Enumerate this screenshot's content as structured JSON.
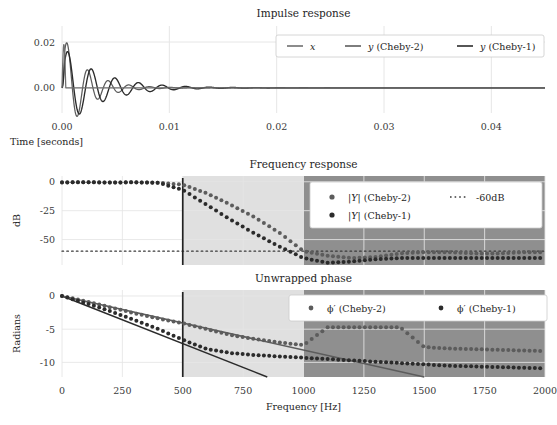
{
  "figure": {
    "width": 557,
    "height": 425,
    "background": "#ffffff"
  },
  "colors": {
    "x_series": "#6f6f6f",
    "cheby2": "#5c5c5c",
    "cheby1": "#2b2b2b",
    "ref_line": "#3a3a3a",
    "grid": "#e6e6e6",
    "transition_band": "#e0e0e0",
    "stop_band": "#8f8f8f",
    "cutoff_line": "#222222",
    "text": "#262626",
    "legend_face": "#ffffff",
    "legend_edge": "#cccccc"
  },
  "panels": [
    {
      "id": "impulse",
      "title": "Impulse response",
      "xlabel": "Time [seconds]",
      "ylabel": "",
      "xticks": [
        "0.00",
        "0.01",
        "0.02",
        "0.03",
        "0.04"
      ],
      "xtick_values": [
        0.0,
        0.01,
        0.02,
        0.03,
        0.04
      ],
      "yticks": [
        "0.02",
        "0.00"
      ],
      "ytick_values": [
        0.02,
        0.0
      ],
      "xlim": [
        0.0,
        0.045
      ],
      "ylim": [
        -0.011,
        0.027
      ],
      "legend": [
        {
          "label": "x",
          "marker": "line",
          "color": "#6f6f6f"
        },
        {
          "label": "y (Cheby-2)",
          "marker": "line",
          "color": "#5c5c5c"
        },
        {
          "label": "y (Cheby-1)",
          "marker": "line",
          "color": "#2b2b2b"
        }
      ]
    },
    {
      "id": "frequency",
      "title": "Frequency response",
      "xlabel": "",
      "ylabel": "dB",
      "yticks": [
        "0",
        "-25",
        "-50"
      ],
      "ytick_values": [
        0,
        -25,
        -50
      ],
      "xlim": [
        0,
        2000
      ],
      "ylim": [
        -72,
        5
      ],
      "legend": [
        {
          "label": "|Y| (Cheby-2)",
          "marker": "dot",
          "color": "#5c5c5c"
        },
        {
          "label": "-60dB",
          "marker": "dotline",
          "color": "#3a3a3a"
        },
        {
          "label": "|Y| (Cheby-1)",
          "marker": "dot",
          "color": "#2b2b2b"
        }
      ],
      "reference_level_db": -60
    },
    {
      "id": "phase",
      "title": "Unwrapped phase",
      "xlabel": "Frequency [Hz]",
      "ylabel": "Radians",
      "xticks": [
        "0",
        "250",
        "500",
        "750",
        "1000",
        "1250",
        "1500",
        "1750",
        "2000"
      ],
      "xtick_values": [
        0,
        250,
        500,
        750,
        1000,
        1250,
        1500,
        1750,
        2000
      ],
      "yticks": [
        "0",
        "-5",
        "-10"
      ],
      "ytick_values": [
        0,
        -5,
        -10
      ],
      "xlim": [
        0,
        2000
      ],
      "ylim": [
        -12.2,
        0.9
      ],
      "legend": [
        {
          "label": "ϕ′ (Cheby-2)",
          "marker": "dot",
          "color": "#5c5c5c"
        },
        {
          "label": "ϕ′ (Cheby-1)",
          "marker": "dot",
          "color": "#2b2b2b"
        }
      ]
    }
  ],
  "bands": {
    "passband_edge_hz": 500,
    "stopband_edge_hz": 1000,
    "transition_range_hz": [
      500,
      1000
    ],
    "stop_range_hz": [
      1000,
      2000
    ]
  },
  "chart_data": {
    "type": "line",
    "panels": [
      {
        "name": "Impulse response",
        "type": "line",
        "xlabel": "Time [seconds]",
        "ylabel": "",
        "xlim": [
          0.0,
          0.045
        ],
        "ylim": [
          -0.011,
          0.027
        ],
        "grid": true,
        "legend_position": "upper right",
        "series": [
          {
            "name": "x",
            "color": "#6f6f6f",
            "description": "impulse input, single narrow spike at t=0 reaching 0.019 then flat at 0",
            "decay_tau": 0.0008,
            "freq_hz": 620,
            "amplitude": 0.019,
            "kind": "spike"
          },
          {
            "name": "y (Cheby-2)",
            "color": "#5c5c5c",
            "description": "damped oscillation, first peak ~0.0245 near t=0.0011, decaying ringing",
            "decay_tau": 0.0021,
            "freq_hz": 520,
            "amplitude": 0.0245,
            "kind": "damped-sine"
          },
          {
            "name": "y (Cheby-1)",
            "color": "#2b2b2b",
            "description": "damped oscillation, first peak ~0.0185 near t=0.0021, longer ringing tail",
            "decay_tau": 0.0034,
            "freq_hz": 455,
            "amplitude": 0.0185,
            "kind": "damped-sine"
          }
        ]
      },
      {
        "name": "Frequency response",
        "type": "scatter",
        "xlabel": "Frequency [Hz]",
        "ylabel": "dB",
        "xlim": [
          0,
          2000
        ],
        "ylim": [
          -72,
          5
        ],
        "grid": true,
        "legend_position": "upper right",
        "annotations": [
          {
            "kind": "vline",
            "x": 500,
            "label": "cutoff"
          },
          {
            "kind": "hline",
            "y": -60,
            "label": "-60dB",
            "style": "dotted"
          },
          {
            "kind": "vspan",
            "x0": 500,
            "x1": 1000,
            "label": "transition band",
            "color": "#e0e0e0"
          },
          {
            "kind": "vspan",
            "x0": 1000,
            "x1": 2000,
            "label": "stop band",
            "color": "#8f8f8f"
          }
        ],
        "series": [
          {
            "name": "|Y| (Cheby-2)",
            "color": "#5c5c5c",
            "x": [
              0,
              100,
              200,
              300,
              400,
              500,
              600,
              700,
              800,
              900,
              1000,
              1100,
              1200,
              1300,
              1400,
              1500,
              1600,
              1700,
              1800,
              1900,
              2000
            ],
            "y": [
              -0.5,
              -0.4,
              -0.6,
              -0.5,
              -0.8,
              -2.5,
              -10,
              -20,
              -31,
              -44,
              -60,
              -64,
              -66,
              -65,
              -62,
              -61,
              -61,
              -62,
              -62,
              -61,
              -61
            ]
          },
          {
            "name": "|Y| (Cheby-1)",
            "color": "#2b2b2b",
            "x": [
              0,
              100,
              200,
              300,
              400,
              500,
              600,
              700,
              800,
              900,
              1000,
              1100,
              1200,
              1300,
              1400,
              1500,
              1600,
              1700,
              1800,
              1900,
              2000
            ],
            "y": [
              -0.6,
              -0.3,
              -0.7,
              -0.4,
              -0.9,
              -7,
              -20,
              -33,
              -45,
              -56,
              -66,
              -70,
              -69,
              -67,
              -66,
              -66,
              -66,
              -66,
              -66,
              -66,
              -66
            ]
          },
          {
            "name": "-60dB",
            "color": "#3a3a3a",
            "style": "dotted",
            "constant": -60
          }
        ]
      },
      {
        "name": "Unwrapped phase",
        "type": "scatter",
        "xlabel": "Frequency [Hz]",
        "ylabel": "Radians",
        "xlim": [
          0,
          2000
        ],
        "ylim": [
          -12.2,
          0.9
        ],
        "grid": true,
        "legend_position": "upper right",
        "annotations": [
          {
            "kind": "vline",
            "x": 500,
            "label": "cutoff"
          },
          {
            "kind": "vspan",
            "x0": 500,
            "x1": 1000,
            "label": "transition band",
            "color": "#e0e0e0"
          },
          {
            "kind": "vspan",
            "x0": 1000,
            "x1": 2000,
            "label": "stop band",
            "color": "#8f8f8f"
          },
          {
            "kind": "trendline",
            "from": [
              0,
              0
            ],
            "to": [
              850,
              -12.2
            ],
            "color": "#2b2b2b"
          },
          {
            "kind": "trendline",
            "from": [
              0,
              0
            ],
            "to": [
              1500,
              -12.2
            ],
            "color": "#5c5c5c"
          }
        ],
        "series": [
          {
            "name": "ϕ′ (Cheby-2)",
            "color": "#5c5c5c",
            "x": [
              0,
              100,
              200,
              300,
              400,
              500,
              600,
              700,
              800,
              900,
              1000,
              1100,
              1200,
              1300,
              1400,
              1500,
              1600,
              1700,
              1800,
              1900,
              2000
            ],
            "y": [
              0.0,
              -0.8,
              -1.7,
              -2.6,
              -3.4,
              -4.1,
              -5.0,
              -5.9,
              -6.5,
              -7.0,
              -7.4,
              -4.7,
              -4.7,
              -4.7,
              -4.7,
              -7.7,
              -7.9,
              -8.0,
              -8.1,
              -8.2,
              -8.3
            ]
          },
          {
            "name": "ϕ′ (Cheby-1)",
            "color": "#2b2b2b",
            "x": [
              0,
              100,
              200,
              300,
              400,
              500,
              600,
              700,
              800,
              900,
              1000,
              1100,
              1200,
              1300,
              1400,
              1500,
              1600,
              1700,
              1800,
              1900,
              2000
            ],
            "y": [
              0.0,
              -1.1,
              -2.3,
              -3.6,
              -5.0,
              -6.6,
              -8.0,
              -8.6,
              -8.9,
              -9.1,
              -9.3,
              -9.5,
              -9.7,
              -9.9,
              -10.1,
              -10.3,
              -10.5,
              -10.6,
              -10.7,
              -10.8,
              -10.9
            ]
          }
        ]
      }
    ]
  }
}
